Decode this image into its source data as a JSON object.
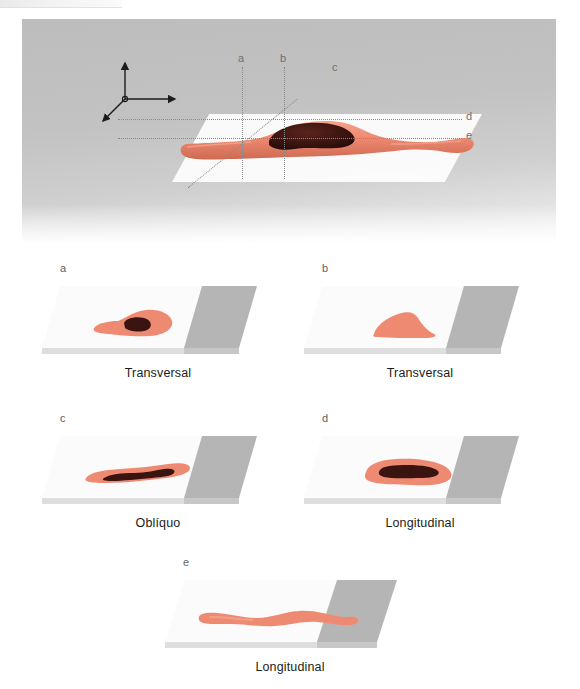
{
  "figure": {
    "type": "anatomical-section-diagram",
    "language": "pt-BR",
    "colors": {
      "organ_fill": "#ef8a72",
      "organ_edge": "#d9694f",
      "lesion_fill": "#3a1410",
      "slab_top": "#fbfbfb",
      "slab_gray": "#b5b5b5",
      "panel_bg": "#c4c4c4",
      "label_text": "#1b1b1b",
      "cut_line": "#8a8a8a"
    }
  },
  "overview": {
    "name": "three-dimensional-overview",
    "axis_origin_label": "o",
    "cut_labels": [
      {
        "id": "a",
        "label": "a",
        "orientation": "vertical"
      },
      {
        "id": "b",
        "label": "b",
        "orientation": "vertical"
      },
      {
        "id": "c",
        "label": "c",
        "orientation": "diagonal"
      },
      {
        "id": "d",
        "label": "d",
        "orientation": "horizontal"
      },
      {
        "id": "e",
        "label": "e",
        "orientation": "horizontal"
      }
    ]
  },
  "sections": [
    {
      "id": "a",
      "letter": "a",
      "caption": "Transversal",
      "has_lesion": true,
      "shape": "ovoid-with-tail"
    },
    {
      "id": "b",
      "letter": "b",
      "caption": "Transversal",
      "has_lesion": false,
      "shape": "triangular-lobe"
    },
    {
      "id": "c",
      "letter": "c",
      "caption": "Oblíquo",
      "has_lesion": true,
      "shape": "elongated-spindle"
    },
    {
      "id": "d",
      "letter": "d",
      "caption": "Longitudinal",
      "has_lesion": true,
      "shape": "broad-elongated"
    },
    {
      "id": "e",
      "letter": "e",
      "caption": "Longitudinal",
      "has_lesion": false,
      "shape": "long-wavy-band"
    }
  ]
}
